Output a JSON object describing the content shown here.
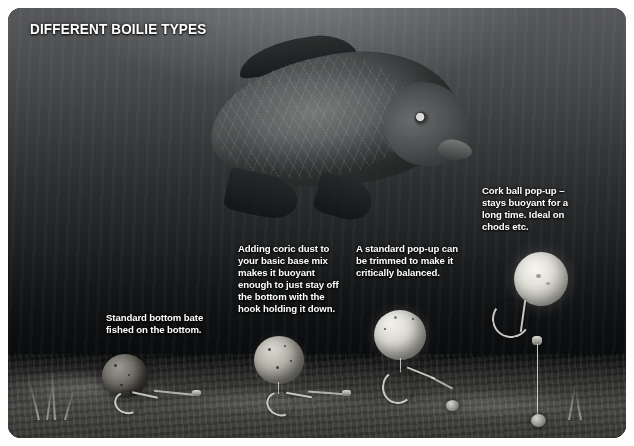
{
  "figure": {
    "title": "DIFFERENT BOILIE TYPES",
    "frame_color": "#ffffff",
    "scene_color": "#0d0f10",
    "text_color": "#ffffff"
  },
  "captions": [
    {
      "id": "standard-bottom-bait",
      "text": "Standard bottom bate fished on the bottom."
    },
    {
      "id": "coric-dust-wafter",
      "text": "Adding coric dust to your basic base mix makes it buoyant enough to just stay off the bottom with the hook holding it down."
    },
    {
      "id": "standard-pop-up",
      "text": "A standard pop-up can be trimmed to make it critically balanced."
    },
    {
      "id": "cork-ball-pop-up",
      "text": "Cork ball pop-up – stays buoyant for a long time. Ideal on chods etc."
    }
  ],
  "scene": {
    "fish": "common-carp",
    "bed": "silty-lake-bed",
    "baits": [
      {
        "name": "bottom-bait",
        "state": "resting-on-bed"
      },
      {
        "name": "wafter-bait",
        "state": "just-off-bottom"
      },
      {
        "name": "pop-up-bait",
        "state": "critically-balanced"
      },
      {
        "name": "cork-ball-pop-up",
        "state": "buoyant-on-chod-rig"
      }
    ]
  }
}
